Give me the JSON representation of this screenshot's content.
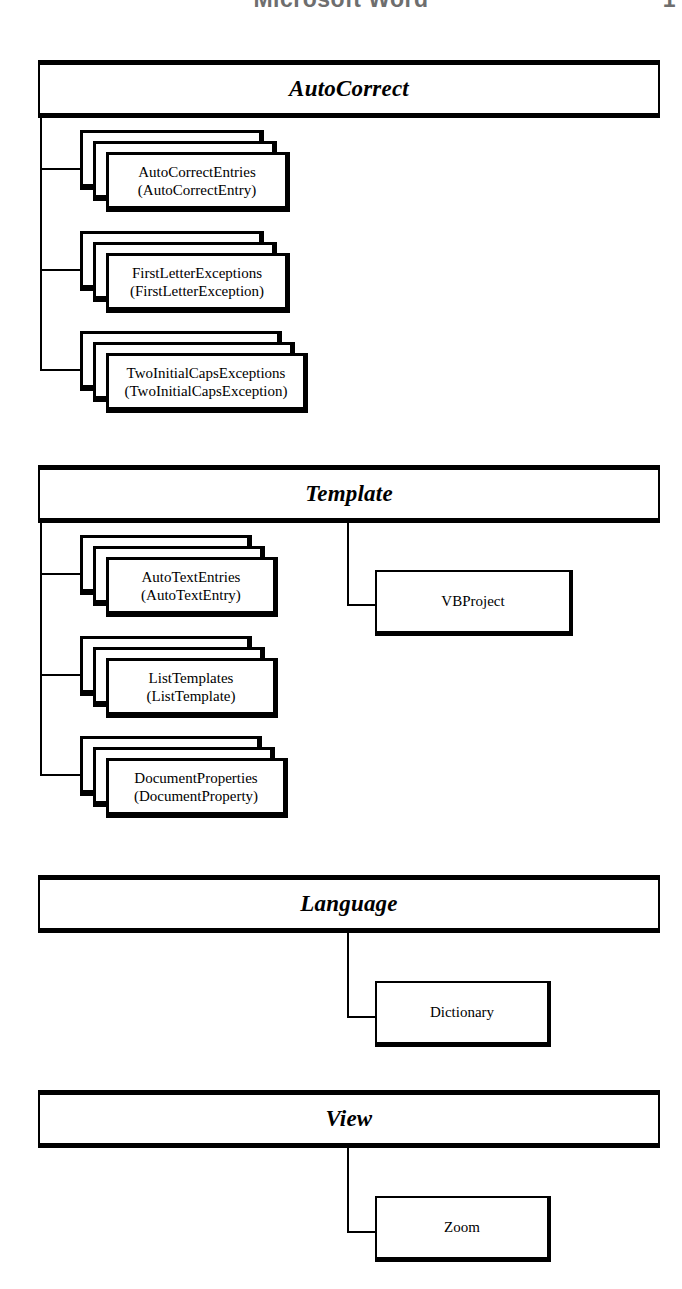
{
  "page": {
    "running_head": "Microsoft Word",
    "folio": "1"
  },
  "diagram": {
    "type": "object-model-hierarchy",
    "sections": [
      {
        "id": "autocorrect",
        "header": "AutoCorrect",
        "children": [
          {
            "kind": "collection",
            "plural": "AutoCorrectEntries",
            "singular": "(AutoCorrectEntry)"
          },
          {
            "kind": "collection",
            "plural": "FirstLetterExceptions",
            "singular": "(FirstLetterException)"
          },
          {
            "kind": "collection",
            "plural": "TwoInitialCapsExceptions",
            "singular": "(TwoInitialCapsException)"
          }
        ],
        "right_children": []
      },
      {
        "id": "template",
        "header": "Template",
        "children": [
          {
            "kind": "collection",
            "plural": "AutoTextEntries",
            "singular": "(AutoTextEntry)"
          },
          {
            "kind": "collection",
            "plural": "ListTemplates",
            "singular": "(ListTemplate)"
          },
          {
            "kind": "collection",
            "plural": "DocumentProperties",
            "singular": "(DocumentProperty)"
          }
        ],
        "right_children": [
          {
            "kind": "object",
            "label": "VBProject"
          }
        ]
      },
      {
        "id": "language",
        "header": "Language",
        "children": [],
        "right_children": [
          {
            "kind": "object",
            "label": "Dictionary"
          }
        ]
      },
      {
        "id": "view",
        "header": "View",
        "children": [],
        "right_children": [
          {
            "kind": "object",
            "label": "Zoom"
          }
        ]
      }
    ]
  },
  "colors": {
    "ink": "#000000",
    "paper": "#ffffff",
    "running_head": "#6e6e6e"
  }
}
